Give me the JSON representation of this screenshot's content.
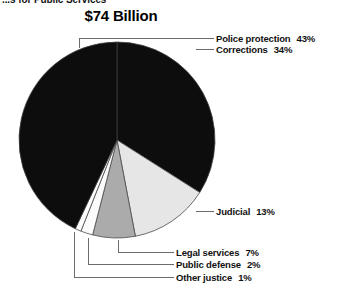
{
  "header": {
    "kicker": "...s for Public Services"
  },
  "chart_data": {
    "type": "pie",
    "title": "$74 Billion",
    "xlabel": "",
    "ylabel": "",
    "units": "percent",
    "total_label": "$74 Billion",
    "legend_position": "callout-labels",
    "grid": false,
    "start_angle_deg": 0,
    "direction": "clockwise",
    "categories": [
      "Corrections",
      "Judicial",
      "Legal services",
      "Public defense",
      "Other justice",
      "Police protection"
    ],
    "values": [
      34,
      13,
      7,
      2,
      1,
      43
    ],
    "slices": [
      {
        "label": "Corrections",
        "value": 34,
        "pct_text": "34%",
        "color": "#0d0d0d"
      },
      {
        "label": "Judicial",
        "value": 13,
        "pct_text": "13%",
        "color": "#e6e6e6"
      },
      {
        "label": "Legal services",
        "value": 7,
        "pct_text": "7%",
        "color": "#ababab"
      },
      {
        "label": "Public defense",
        "value": 2,
        "pct_text": "2%",
        "color": "#fbfbfb"
      },
      {
        "label": "Other justice",
        "value": 1,
        "pct_text": "1%",
        "color": "#fdfdfd"
      },
      {
        "label": "Police protection",
        "value": 43,
        "pct_text": "43%",
        "color": "#0d0d0d"
      }
    ],
    "callouts": [
      {
        "name": "police-protection",
        "label": "Police protection",
        "pct_text": "43%"
      },
      {
        "name": "corrections",
        "label": "Corrections",
        "pct_text": "34%"
      },
      {
        "name": "judicial",
        "label": "Judicial",
        "pct_text": "13%"
      },
      {
        "name": "legal-services",
        "label": "Legal services",
        "pct_text": "7%"
      },
      {
        "name": "public-defense",
        "label": "Public defense",
        "pct_text": "2%"
      },
      {
        "name": "other-justice",
        "label": "Other justice",
        "pct_text": "1%"
      }
    ],
    "colors": {
      "dark": "#0d0d0d",
      "light_gray": "#e6e6e6",
      "mid_gray": "#ababab",
      "near_white": "#fbfbfb",
      "outline": "#4a4a4a",
      "leader_line": "#6b6b6b",
      "text": "#111111",
      "background": "#ffffff"
    }
  }
}
